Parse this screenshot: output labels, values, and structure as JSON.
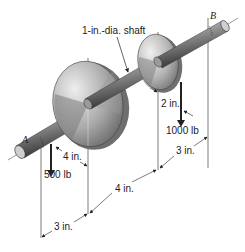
{
  "diagram": {
    "type": "engineering-mechanics-shaft",
    "labels": {
      "shaft": "1-in.-dia. shaft",
      "point_a": "A",
      "point_b": "B",
      "offset_small_disk": "2 in.",
      "offset_large_disk": "4 in.",
      "force_small": "1000 lb",
      "force_large": "500 lb",
      "dim_a_to_large": "3 in.",
      "dim_large_to_small": "4 in.",
      "dim_small_to_b": "3 in."
    },
    "colors": {
      "line": "#333333",
      "disk_light": "#d9d9d9",
      "disk_dark": "#6e6e6e",
      "shaft_light": "#bdbdbd",
      "shaft_dark": "#3a3a3a",
      "force_arrow": "#2a2a2a"
    }
  }
}
